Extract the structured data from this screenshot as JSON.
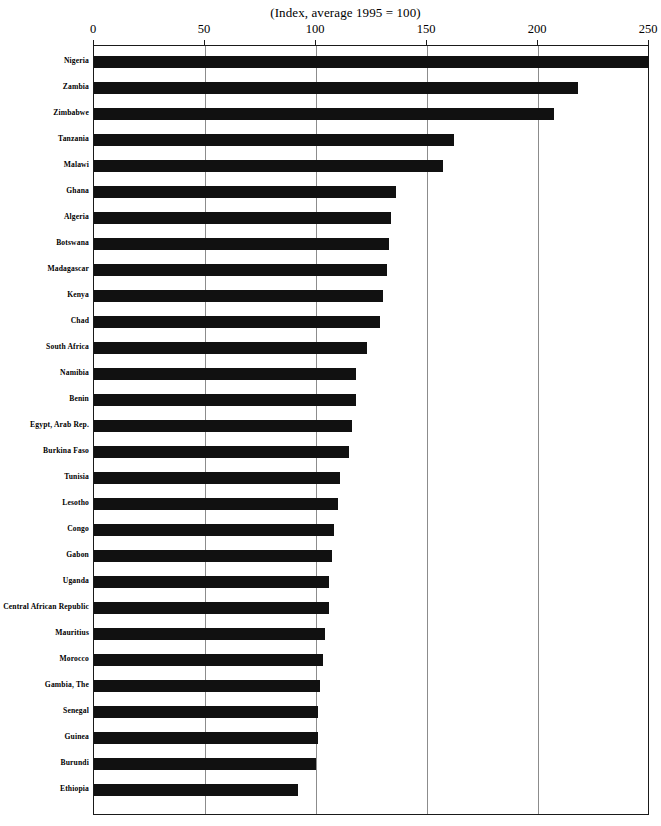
{
  "chart_data": {
    "type": "bar",
    "orientation": "horizontal",
    "title": "(Index, average 1995 = 100)",
    "subtitle": "",
    "xlabel": "",
    "ylabel": "",
    "xlim": [
      0,
      250
    ],
    "xticks": [
      0,
      50,
      100,
      150,
      200,
      250
    ],
    "xtick_labels": [
      "0",
      "50",
      "100",
      "150",
      "200",
      "250"
    ],
    "grid": true,
    "grid_axis": "x",
    "legend": false,
    "legend_position": "none",
    "bar_color": "#111111",
    "categories": [
      "Nigeria",
      "Zambia",
      "Zimbabwe",
      "Tanzania",
      "Malawi",
      "Ghana",
      "Algeria",
      "Botswana",
      "Madagascar",
      "Kenya",
      "Chad",
      "South Africa",
      "Namibia",
      "Benin",
      "Egypt, Arab Rep.",
      "Burkina Faso",
      "Tunisia",
      "Lesotho",
      "Congo",
      "Gabon",
      "Uganda",
      "Central African Republic",
      "Mauritius",
      "Morocco",
      "Gambia, The",
      "Senegal",
      "Guinea",
      "Burundi",
      "Ethiopia"
    ],
    "values": [
      250,
      218,
      207,
      162,
      157,
      136,
      134,
      133,
      132,
      130,
      129,
      123,
      118,
      118,
      116,
      115,
      111,
      110,
      108,
      107,
      106,
      106,
      104,
      103,
      102,
      101,
      101,
      100,
      92
    ]
  }
}
